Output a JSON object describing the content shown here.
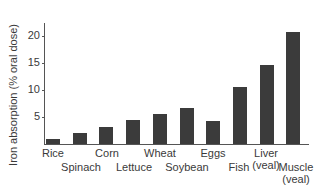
{
  "chart_data": {
    "type": "bar",
    "title": "",
    "xlabel": "",
    "ylabel": "Iron absorption (% oral dose)",
    "ylim": [
      0,
      22
    ],
    "yticks": [
      5,
      10,
      15,
      20
    ],
    "grid": false,
    "legend": null,
    "categories": [
      "Rice",
      "Spinach",
      "Corn",
      "Lettuce",
      "Wheat",
      "Soybean",
      "Eggs",
      "Fish",
      "Liver (veal)",
      "Muscle (veal)"
    ],
    "values": [
      1.0,
      2.0,
      3.2,
      4.5,
      5.6,
      6.7,
      4.3,
      10.6,
      14.7,
      20.8
    ]
  },
  "labels": {
    "ylabel": "Iron absorption (% oral dose)",
    "ticks": [
      "5",
      "10",
      "15",
      "20"
    ],
    "cats": [
      {
        "line1": "Rice",
        "line2": ""
      },
      {
        "line1": "Spinach",
        "line2": ""
      },
      {
        "line1": "Corn",
        "line2": ""
      },
      {
        "line1": "Lettuce",
        "line2": ""
      },
      {
        "line1": "Wheat",
        "line2": ""
      },
      {
        "line1": "Soybean",
        "line2": ""
      },
      {
        "line1": "Eggs",
        "line2": ""
      },
      {
        "line1": "Fish",
        "line2": ""
      },
      {
        "line1": "Liver",
        "line2": "(veal)"
      },
      {
        "line1": "Muscle",
        "line2": "(veal)"
      }
    ]
  },
  "colors": {
    "bar": "#3b3b3b",
    "axis": "#555555",
    "text": "#3a3a3a"
  }
}
